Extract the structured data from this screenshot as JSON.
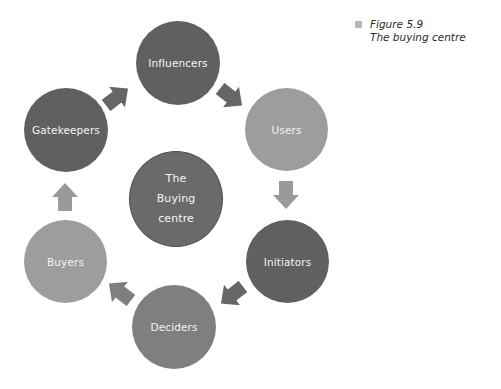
{
  "figure": {
    "number_label": "Figure 5.9",
    "title": "The buying centre",
    "marker_color": "#b8b8b8"
  },
  "center_node": {
    "lines": [
      "The",
      "Buying",
      "centre"
    ],
    "color": "#6a6a6a",
    "border_color": "#4e4e4e"
  },
  "cycle_nodes": [
    {
      "id": "influencers",
      "label": "Influencers",
      "color": "#606060"
    },
    {
      "id": "users",
      "label": "Users",
      "color": "#9d9d9d"
    },
    {
      "id": "initiators",
      "label": "Initiators",
      "color": "#606060"
    },
    {
      "id": "deciders",
      "label": "Deciders",
      "color": "#7f7f7f"
    },
    {
      "id": "buyers",
      "label": "Buyers",
      "color": "#9d9d9d"
    },
    {
      "id": "gatekeepers",
      "label": "Gatekeepers",
      "color": "#606060"
    }
  ],
  "arrows": [
    {
      "from": "gatekeepers",
      "to": "influencers",
      "direction": "up-right",
      "color": "#666666"
    },
    {
      "from": "influencers",
      "to": "users",
      "direction": "down-right",
      "color": "#666666"
    },
    {
      "from": "users",
      "to": "initiators",
      "direction": "down",
      "color": "#9a9a9a"
    },
    {
      "from": "initiators",
      "to": "deciders",
      "direction": "down-left",
      "color": "#666666"
    },
    {
      "from": "deciders",
      "to": "buyers",
      "direction": "up-left",
      "color": "#7f7f7f"
    },
    {
      "from": "buyers",
      "to": "gatekeepers",
      "direction": "up",
      "color": "#9a9a9a"
    }
  ]
}
